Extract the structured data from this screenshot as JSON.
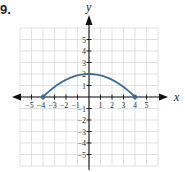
{
  "problem_number": "9.",
  "chart_data": {
    "type": "line",
    "title": "",
    "xlabel": "x",
    "ylabel": "y",
    "xlim": [
      -5,
      5
    ],
    "ylim": [
      -5,
      5
    ],
    "x_ticks": [
      -5,
      -4,
      -3,
      -2,
      -1,
      1,
      2,
      3,
      4,
      5
    ],
    "y_ticks": [
      -5,
      -4,
      -3,
      -2,
      -1,
      1,
      2,
      3,
      4,
      5
    ],
    "grid": true,
    "series": [
      {
        "name": "curve",
        "color": "#3b6a97",
        "description": "downward parabola from (-4,0) through vertex (0,2) to (4,0)",
        "points": [
          [
            -4,
            0
          ],
          [
            -3,
            0.875
          ],
          [
            -2,
            1.5
          ],
          [
            -1,
            1.875
          ],
          [
            0,
            2
          ],
          [
            1,
            1.875
          ],
          [
            2,
            1.5
          ],
          [
            3,
            0.875
          ],
          [
            4,
            0
          ]
        ],
        "endpoints": [
          [
            -4,
            0
          ],
          [
            4,
            0
          ]
        ]
      }
    ]
  },
  "colors": {
    "axis": "#111111",
    "grid": "#d9d9d9",
    "curve": "#3b6a97"
  }
}
